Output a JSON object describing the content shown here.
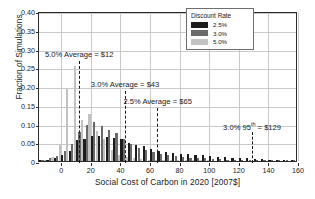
{
  "chart_data": {
    "type": "bar",
    "title": "",
    "xlabel": "Social Cost of Carbon in 2020 [2007$]",
    "ylabel": "Fraction of Simulations",
    "xlim": [
      -15,
      160
    ],
    "ylim": [
      0,
      0.4
    ],
    "xticks": [
      0,
      20,
      40,
      60,
      80,
      100,
      120,
      140,
      160
    ],
    "yticks": [
      0,
      0.05,
      0.1,
      0.15,
      0.2,
      0.25,
      0.3,
      0.35,
      0.4
    ],
    "xticklabels": [
      "0",
      "20",
      "40",
      "60",
      "80",
      "100",
      "120",
      "140",
      "160"
    ],
    "yticklabels": [
      "0",
      "0.05",
      "0.10",
      "0.15",
      "0.20",
      "0.25",
      "0.30",
      "0.35",
      "0.40"
    ],
    "grid": true,
    "legend_position": "upper right",
    "bin_width": 5,
    "bin_centers": [
      -12.5,
      -7.5,
      -2.5,
      2.5,
      7.5,
      12.5,
      17.5,
      22.5,
      27.5,
      32.5,
      37.5,
      42.5,
      47.5,
      52.5,
      57.5,
      62.5,
      67.5,
      72.5,
      77.5,
      82.5,
      87.5,
      92.5,
      97.5,
      102.5,
      107.5,
      112.5,
      117.5,
      122.5,
      127.5,
      132.5,
      137.5,
      142.5,
      147.5,
      152.5,
      157.5
    ],
    "series": [
      {
        "name": "2.5%",
        "color": "#1c1c1c",
        "values": [
          0.002,
          0.004,
          0.009,
          0.015,
          0.028,
          0.057,
          0.06,
          0.068,
          0.068,
          0.063,
          0.062,
          0.059,
          0.049,
          0.043,
          0.04,
          0.031,
          0.026,
          0.024,
          0.021,
          0.019,
          0.018,
          0.016,
          0.015,
          0.013,
          0.012,
          0.01,
          0.009,
          0.008,
          0.007,
          0.006,
          0.005,
          0.004,
          0.004,
          0.003,
          0.003
        ]
      },
      {
        "name": "3.0%",
        "color": "#6a6a6a",
        "values": [
          0.003,
          0.007,
          0.014,
          0.026,
          0.046,
          0.078,
          0.096,
          0.103,
          0.093,
          0.083,
          0.076,
          0.06,
          0.046,
          0.035,
          0.029,
          0.023,
          0.018,
          0.015,
          0.013,
          0.011,
          0.009,
          0.008,
          0.007,
          0.006,
          0.005,
          0.004,
          0.004,
          0.003,
          0.003,
          0.002,
          0.002,
          0.002,
          0.001,
          0.001,
          0.001
        ]
      },
      {
        "name": "5.0%",
        "color": "#c2c2c2",
        "values": [
          0.004,
          0.012,
          0.044,
          0.193,
          0.254,
          0.11,
          0.126,
          0.08,
          0.06,
          0.03,
          0.017,
          0.01,
          0.007,
          0.005,
          0.004,
          0.003,
          0.002,
          0.002,
          0.001,
          0.001,
          0.001,
          0.001,
          0.001,
          0.0,
          0.0,
          0.0,
          0.0,
          0.0,
          0.0,
          0.0,
          0.0,
          0.0,
          0.0,
          0.0,
          0.0
        ]
      }
    ],
    "annotations": [
      {
        "label": "5.0% Average = $12",
        "value": 12,
        "sup": "",
        "label_x": 12,
        "label_y": 0.272,
        "align": "center"
      },
      {
        "label": "3.0% Average = $43",
        "value": 43,
        "sup": "",
        "label_x": 43,
        "label_y": 0.193,
        "align": "center"
      },
      {
        "label": "2.5% Average = $65",
        "value": 65,
        "sup": "",
        "label_x": 65,
        "label_y": 0.146,
        "align": "center"
      },
      {
        "label": "3.0% 95",
        "value": 129,
        "sup": "th",
        "label_x": 129,
        "label_y": 0.082,
        "align": "center",
        "label_tail": " = $129"
      }
    ]
  },
  "legend": {
    "title": "Discount Rate",
    "items": [
      {
        "label": "2.5%",
        "color": "#1c1c1c"
      },
      {
        "label": "3.0%",
        "color": "#6a6a6a"
      },
      {
        "label": "5.0%",
        "color": "#c2c2c2"
      }
    ]
  }
}
